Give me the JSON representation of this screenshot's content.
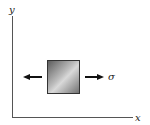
{
  "diagram": {
    "axes": {
      "x_label": "x",
      "y_label": "y"
    },
    "element": {
      "description": "square stress element"
    },
    "stress_label": "σ",
    "arrows": [
      "left-arrow",
      "right-arrow"
    ]
  }
}
